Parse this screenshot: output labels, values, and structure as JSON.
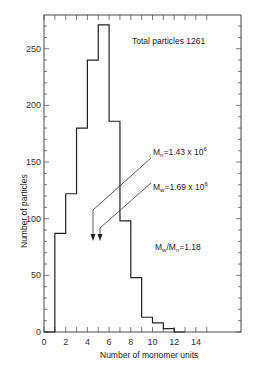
{
  "chart_data": {
    "type": "bar",
    "subtype": "histogram",
    "title": "",
    "xlabel": "Number of monomer units",
    "ylabel": "Number of particles",
    "xlim": [
      0,
      18.5
    ],
    "ylim": [
      0,
      280
    ],
    "x_ticks": [
      0,
      2,
      4,
      6,
      8,
      10,
      12,
      14
    ],
    "y_ticks": [
      0,
      50,
      100,
      150,
      200,
      250
    ],
    "grid": false,
    "bins": [
      {
        "x0": 0,
        "x1": 1,
        "count": 0
      },
      {
        "x0": 1,
        "x1": 2,
        "count": 87
      },
      {
        "x0": 2,
        "x1": 3,
        "count": 122
      },
      {
        "x0": 3,
        "x1": 4,
        "count": 180
      },
      {
        "x0": 4,
        "x1": 5,
        "count": 240
      },
      {
        "x0": 5,
        "x1": 6,
        "count": 271
      },
      {
        "x0": 6,
        "x1": 7,
        "count": 186
      },
      {
        "x0": 7,
        "x1": 8,
        "count": 98
      },
      {
        "x0": 8,
        "x1": 9,
        "count": 48
      },
      {
        "x0": 9,
        "x1": 10,
        "count": 13
      },
      {
        "x0": 10,
        "x1": 11,
        "count": 8
      },
      {
        "x0": 11,
        "x1": 12,
        "count": 3
      },
      {
        "x0": 12,
        "x1": 13,
        "count": 0
      }
    ],
    "categories": [
      "1-2",
      "2-3",
      "3-4",
      "4-5",
      "5-6",
      "6-7",
      "7-8",
      "8-9",
      "9-10",
      "10-11",
      "11-12"
    ],
    "values": [
      87,
      122,
      180,
      240,
      271,
      186,
      98,
      48,
      13,
      8,
      3
    ],
    "annotations": [
      {
        "text": "Total particles 1261",
        "position": "top-right"
      },
      {
        "text": "Mn = 1.43 x 10^6",
        "arrow_to_x": 4.6
      },
      {
        "text": "Mw = 1.69 x 10^6",
        "arrow_to_x": 5.3
      },
      {
        "text": "Mw/Mn = 1.18"
      }
    ]
  },
  "labels": {
    "xlabel": "Number of monomer units",
    "ylabel": "Number of particles",
    "total": "Total particles 1261",
    "mn_sym": "M",
    "mn_sub": "n",
    "mn_val": "=1.43 x 10",
    "mn_exp": "6",
    "mw_sym": "M",
    "mw_sub": "w",
    "mw_val": "=1.69 x 10",
    "mw_exp": "6",
    "ratio_a": "M",
    "ratio_a_sub": "w",
    "ratio_slash": "/M",
    "ratio_b_sub": "n",
    "ratio_val": "=1.18",
    "y_ticks": [
      "0",
      "50",
      "100",
      "150",
      "200",
      "250"
    ],
    "x_ticks": [
      "0",
      "2",
      "4",
      "6",
      "8",
      "10",
      "12",
      "14"
    ]
  }
}
